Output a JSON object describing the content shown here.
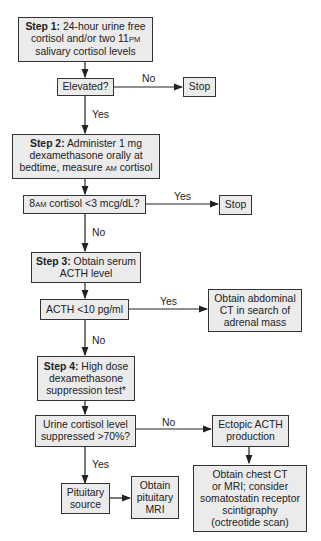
{
  "diagram": {
    "nodes": {
      "step1": {
        "label": "Step 1:",
        "text_a": " 24-hour urine free",
        "text_b": "cortisol and/or two 11",
        "text_b_sc": "PM",
        "text_c": "salivary cortisol levels"
      },
      "elevated": {
        "text": "Elevated?"
      },
      "stop1": {
        "text": "Stop"
      },
      "step2": {
        "label": "Step 2:",
        "text_a": " Administer 1 mg",
        "text_b": "dexamethasone orally at",
        "text_c": "bedtime, measure ",
        "text_c_sc": "AM",
        "text_c_end": " cortisol"
      },
      "cortisol_check": {
        "pre": "8",
        "pre_sc": "AM",
        "text": " cortisol <3 mcg/dL?"
      },
      "stop2": {
        "text": "Stop"
      },
      "step3": {
        "label": "Step 3:",
        "text_a": " Obtain serum",
        "text_b": "ACTH level"
      },
      "acth_check": {
        "text": "ACTH <10 pg/ml"
      },
      "abdominal_ct": {
        "line1": "Obtain abdominal",
        "line2": "CT in search of",
        "line3": "adrenal mass"
      },
      "step4": {
        "label": "Step 4:",
        "text_a": " High dose",
        "text_b": "dexamethasone",
        "text_c": "suppression test*"
      },
      "urine_check": {
        "line1": "Urine cortisol level",
        "line2": "suppressed >70%?"
      },
      "ectopic": {
        "line1": "Ectopic ACTH",
        "line2": "production"
      },
      "pituitary": {
        "line1": "Pituitary",
        "line2": "source"
      },
      "pituitary_mri": {
        "line1": "Obtain",
        "line2": "pituitary",
        "line3": "MRI"
      },
      "chest_ct": {
        "line1": "Obtain chest CT",
        "line2": "or MRI; consider",
        "line3": "somatostatin receptor",
        "line4": "scintigraphy",
        "line5": "(octreotide scan)"
      }
    },
    "edges": {
      "elevated_no": "No",
      "elevated_yes": "Yes",
      "cortisol_yes": "Yes",
      "cortisol_no": "No",
      "acth_yes": "Yes",
      "acth_no": "No",
      "urine_no": "No",
      "urine_yes": "Yes"
    },
    "colors": {
      "box_fill": "#ebebeb",
      "stroke": "#333333"
    }
  }
}
